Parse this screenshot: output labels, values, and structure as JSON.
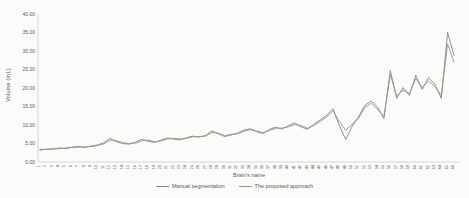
{
  "figure": {
    "background": "#fbfbf9",
    "axis_color": "#c6c6c6",
    "text_color": "#595959"
  },
  "chart_data": {
    "type": "line",
    "title": "",
    "xlabel": "Brain's name",
    "ylabel": "Volume (mL)",
    "ylim": [
      0,
      40
    ],
    "ytick_step": 5,
    "ytick_labels": [
      "0.00",
      "5.00",
      "10.00",
      "15.00",
      "20.00",
      "25.00",
      "30.00",
      "35.00",
      "40.00"
    ],
    "grid": false,
    "legend_position": "bottom-center",
    "categories": [
      "1",
      "2",
      "3",
      "4",
      "5",
      "6",
      "7",
      "8",
      "9",
      "10",
      "11",
      "12",
      "13",
      "14",
      "15",
      "16",
      "17",
      "18",
      "19",
      "20",
      "21",
      "22",
      "23",
      "24",
      "25",
      "26",
      "27",
      "28",
      "29",
      "30",
      "31",
      "32",
      "33",
      "34",
      "35",
      "36",
      "37",
      "38",
      "39",
      "40",
      "41",
      "42",
      "43",
      "44",
      "45",
      "46",
      "47",
      "48",
      "49",
      "50",
      "51",
      "52",
      "53",
      "54",
      "55",
      "56",
      "57",
      "58",
      "59",
      "60",
      "61",
      "62",
      "63",
      "64",
      "65",
      "66"
    ],
    "series": [
      {
        "name": "Manual segmentation",
        "color": "#7d868f",
        "values": [
          3.2,
          3.5,
          3.4,
          3.8,
          3.6,
          4.0,
          4.2,
          3.9,
          4.3,
          4.6,
          5.2,
          6.4,
          5.5,
          5.0,
          4.8,
          5.4,
          6.1,
          5.6,
          5.3,
          5.9,
          6.5,
          6.2,
          6.0,
          6.6,
          7.0,
          6.7,
          7.2,
          8.4,
          7.6,
          6.9,
          7.3,
          7.8,
          8.6,
          9.0,
          8.2,
          7.7,
          8.8,
          9.4,
          8.9,
          9.8,
          10.6,
          9.5,
          8.8,
          10.2,
          11.4,
          12.6,
          14.4,
          9.8,
          6.1,
          9.6,
          12.2,
          15.3,
          16.5,
          14.8,
          11.7,
          24.7,
          17.2,
          20.1,
          18.0,
          23.4,
          19.6,
          22.8,
          21.0,
          17.2,
          35.0,
          28.8
        ]
      },
      {
        "name": "The proposed approach",
        "color": "#a08f85",
        "values": [
          3.4,
          3.4,
          3.6,
          3.6,
          3.8,
          3.9,
          4.0,
          4.1,
          4.2,
          4.4,
          4.9,
          5.9,
          5.8,
          5.2,
          5.0,
          5.1,
          5.7,
          5.9,
          5.5,
          5.7,
          6.2,
          6.4,
          6.2,
          6.4,
          6.8,
          6.9,
          7.0,
          8.0,
          7.8,
          7.1,
          7.5,
          7.6,
          8.3,
          8.7,
          8.4,
          7.9,
          8.5,
          9.1,
          9.2,
          9.5,
          10.1,
          9.8,
          9.1,
          9.9,
          11.0,
          12.1,
          13.8,
          10.9,
          8.6,
          10.2,
          11.8,
          14.7,
          15.9,
          14.2,
          12.3,
          23.6,
          17.8,
          19.4,
          18.5,
          22.5,
          20.2,
          21.9,
          20.4,
          18.0,
          31.9,
          27.0
        ]
      }
    ]
  }
}
